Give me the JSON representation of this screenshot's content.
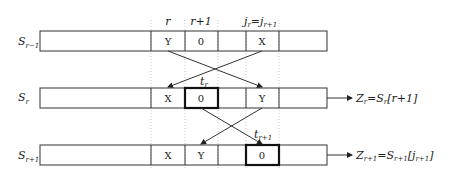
{
  "column_headers": {
    "r": "r",
    "r1": "r+1",
    "j_main": "j",
    "j_sub": "r",
    "eq": "=",
    "j2_main": "j",
    "j2_sub": "r+1"
  },
  "rows": [
    {
      "label_main": "S",
      "label_sub": "r−1",
      "cells": {
        "c1": "Y",
        "c2": "0",
        "c4": "X"
      }
    },
    {
      "label_main": "S",
      "label_sub": "r",
      "cells": {
        "c1": "X",
        "c2": "0",
        "c4": "Y"
      },
      "output": {
        "z": "Z",
        "z_sub": "r",
        "eq": "=S",
        "s_sub": "r",
        "idx": "[r+1]"
      }
    },
    {
      "label_main": "S",
      "label_sub": "r+1",
      "cells": {
        "c1": "X",
        "c2": "Y",
        "c4": "0"
      },
      "output": {
        "z": "Z",
        "z_sub": "r+1",
        "eq": "=S",
        "s_sub": "r+1",
        "idx_open": "[j",
        "idx_sub": "r+1",
        "idx_close": "]"
      }
    }
  ],
  "swap_labels": [
    {
      "main": "t",
      "sub": "r"
    },
    {
      "main": "t",
      "sub": "r+1"
    }
  ]
}
